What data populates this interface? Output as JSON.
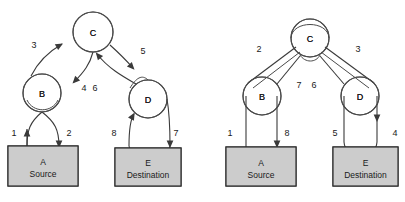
{
  "figure": {
    "background": "#ffffff",
    "stroke_color": "#3a3a3a",
    "box_fill": "#cccccc",
    "box_stroke": "#2e2e2e"
  },
  "diagrams": [
    {
      "id": "left-diagram",
      "name": "depth-first-traversal",
      "nodes": [
        {
          "id": "A",
          "label": "A",
          "sublabel": "Source",
          "shape": "rect",
          "x": 8,
          "y": 146,
          "w": 70,
          "h": 40
        },
        {
          "id": "B",
          "label": "B",
          "shape": "circle",
          "cx": 42,
          "cy": 93,
          "r": 19
        },
        {
          "id": "C",
          "label": "C",
          "shape": "circle",
          "cx": 93,
          "cy": 32,
          "r": 20
        },
        {
          "id": "D",
          "label": "D",
          "shape": "circle",
          "cx": 148,
          "cy": 99,
          "r": 19
        },
        {
          "id": "E",
          "label": "E",
          "sublabel": "Destination",
          "shape": "rect",
          "x": 115,
          "y": 148,
          "w": 66,
          "h": 38
        }
      ],
      "edges": [
        {
          "number": "1",
          "from": "B",
          "to": "A",
          "label_x": 14,
          "label_y": 136
        },
        {
          "number": "2",
          "from": "A",
          "to": "B",
          "label_x": 69,
          "label_y": 136
        },
        {
          "number": "3",
          "from": "B",
          "to": "C",
          "label_x": 34,
          "label_y": 48
        },
        {
          "number": "4",
          "from": "C",
          "to": "B",
          "label_x": 84,
          "label_y": 91
        },
        {
          "number": "5",
          "from": "C",
          "to": "D",
          "label_x": 143,
          "label_y": 54
        },
        {
          "number": "6",
          "from": "D",
          "to": "C",
          "label_x": 95,
          "label_y": 91
        },
        {
          "number": "7",
          "from": "D",
          "to": "E",
          "label_x": 176,
          "label_y": 136
        },
        {
          "number": "8",
          "from": "E",
          "to": "D",
          "label_x": 114,
          "label_y": 136
        }
      ]
    },
    {
      "id": "right-diagram",
      "name": "breadth-first-traversal",
      "nodes": [
        {
          "id": "A",
          "label": "A",
          "sublabel": "Source",
          "shape": "rect",
          "x": 226,
          "y": 147,
          "w": 70,
          "h": 39
        },
        {
          "id": "B",
          "label": "B",
          "shape": "circle",
          "cx": 262,
          "cy": 96,
          "r": 19
        },
        {
          "id": "C",
          "label": "C",
          "shape": "circle",
          "cx": 310,
          "cy": 38,
          "r": 19
        },
        {
          "id": "D",
          "label": "D",
          "shape": "circle",
          "cx": 360,
          "cy": 96,
          "r": 19
        },
        {
          "id": "E",
          "label": "E",
          "sublabel": "Destination",
          "shape": "rect",
          "x": 333,
          "y": 147,
          "w": 65,
          "h": 39
        }
      ],
      "edges": [
        {
          "number": "1",
          "from": "A",
          "to": "B",
          "label_x": 230,
          "label_y": 136
        },
        {
          "number": "2",
          "from": "B",
          "to": "C",
          "label_x": 259,
          "label_y": 52
        },
        {
          "number": "3",
          "from": "C",
          "to": "D",
          "label_x": 358,
          "label_y": 52
        },
        {
          "number": "4",
          "from": "D",
          "to": "E",
          "label_x": 395,
          "label_y": 136
        },
        {
          "number": "5",
          "from": "E",
          "to": "D",
          "label_x": 335,
          "label_y": 136
        },
        {
          "number": "6",
          "from": "C",
          "to": "D",
          "label_x": 314,
          "label_y": 88
        },
        {
          "number": "7",
          "from": "C",
          "to": "B",
          "label_x": 299,
          "label_y": 88
        },
        {
          "number": "8",
          "from": "B",
          "to": "A",
          "label_x": 287,
          "label_y": 136
        }
      ]
    }
  ]
}
